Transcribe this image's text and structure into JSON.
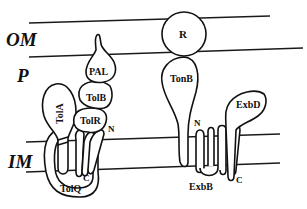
{
  "diagram": {
    "regions": {
      "outer_membrane": "OM",
      "periplasm": "P",
      "inner_membrane": "IM"
    },
    "proteins": {
      "pal": "PAL",
      "tolb": "TolB",
      "tola": "TolA",
      "tolr": "TolR",
      "tolq": "TolQ",
      "receptor": "R",
      "tonb": "TonB",
      "exbd": "ExbD",
      "exbb": "ExbB"
    },
    "termini": {
      "tolr_n": "N",
      "tolr_c": "C",
      "tonb_n": "N",
      "exbd_c": "C"
    },
    "colors": {
      "line": "#111111",
      "background": "#ffffff"
    }
  }
}
